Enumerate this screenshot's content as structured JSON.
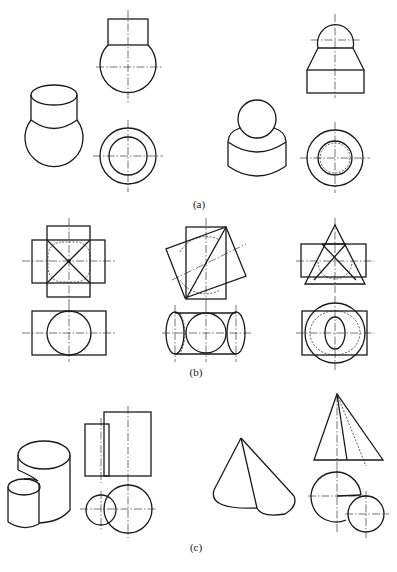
{
  "figure": {
    "type": "engineering-drawing",
    "panels": [
      {
        "label": "(a)",
        "items": [
          "isometric cylinder on sphere",
          "front/top view: rectangle on circle",
          "isometric sphere on cylinder",
          "front/top view: sphere on frustum on block"
        ]
      },
      {
        "label": "(b)",
        "items": [
          "crossed rectangles with inscribed circle",
          "rotated squares with cylinder",
          "triangle over rectangle with circles"
        ]
      },
      {
        "label": "(c)",
        "items": [
          "isometric two cylinders",
          "front/top view two cylinders",
          "isometric split cone",
          "front/top view split cone"
        ]
      }
    ]
  },
  "captions": {
    "a": "(a)",
    "b": "(b)",
    "c": "(c)"
  },
  "colors": {
    "line": "#1a1a1a",
    "background": "#ffffff"
  }
}
